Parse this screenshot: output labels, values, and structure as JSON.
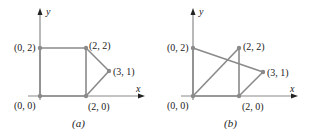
{
  "colors": {
    "edge": "#8a8a8a",
    "vertex": "#8a8a8a",
    "axis": "#8a8a8a",
    "arrow": "#222222",
    "text": "#222222"
  },
  "axes": {
    "x_label": "x",
    "y_label": "y"
  },
  "panels": [
    {
      "caption": "(a)",
      "vertices": [
        {
          "label": "(0, 0)",
          "x": 0,
          "y": 0
        },
        {
          "label": "(0, 2)",
          "x": 0,
          "y": 2
        },
        {
          "label": "(2, 2)",
          "x": 2,
          "y": 2
        },
        {
          "label": "(3, 1)",
          "x": 3,
          "y": 1
        },
        {
          "label": "(2, 0)",
          "x": 2,
          "y": 0
        }
      ],
      "edges": [
        [
          "(0, 0)",
          "(0, 2)"
        ],
        [
          "(0, 2)",
          "(2, 2)"
        ],
        [
          "(2, 2)",
          "(2, 0)"
        ],
        [
          "(2, 0)",
          "(0, 0)"
        ],
        [
          "(2, 2)",
          "(3, 1)"
        ],
        [
          "(3, 1)",
          "(2, 0)"
        ]
      ]
    },
    {
      "caption": "(b)",
      "vertices": [
        {
          "label": "(0, 0)",
          "x": 0,
          "y": 0
        },
        {
          "label": "(0, 2)",
          "x": 0,
          "y": 2
        },
        {
          "label": "(2, 2)",
          "x": 2,
          "y": 2
        },
        {
          "label": "(3, 1)",
          "x": 3,
          "y": 1
        },
        {
          "label": "(2, 0)",
          "x": 2,
          "y": 0
        }
      ],
      "edges": [
        [
          "(0, 0)",
          "(0, 2)"
        ],
        [
          "(0, 2)",
          "(3, 1)"
        ],
        [
          "(3, 1)",
          "(2, 0)"
        ],
        [
          "(2, 0)",
          "(2, 2)"
        ],
        [
          "(2, 2)",
          "(0, 0)"
        ],
        [
          "(0, 0)",
          "(2, 0)"
        ]
      ]
    }
  ]
}
